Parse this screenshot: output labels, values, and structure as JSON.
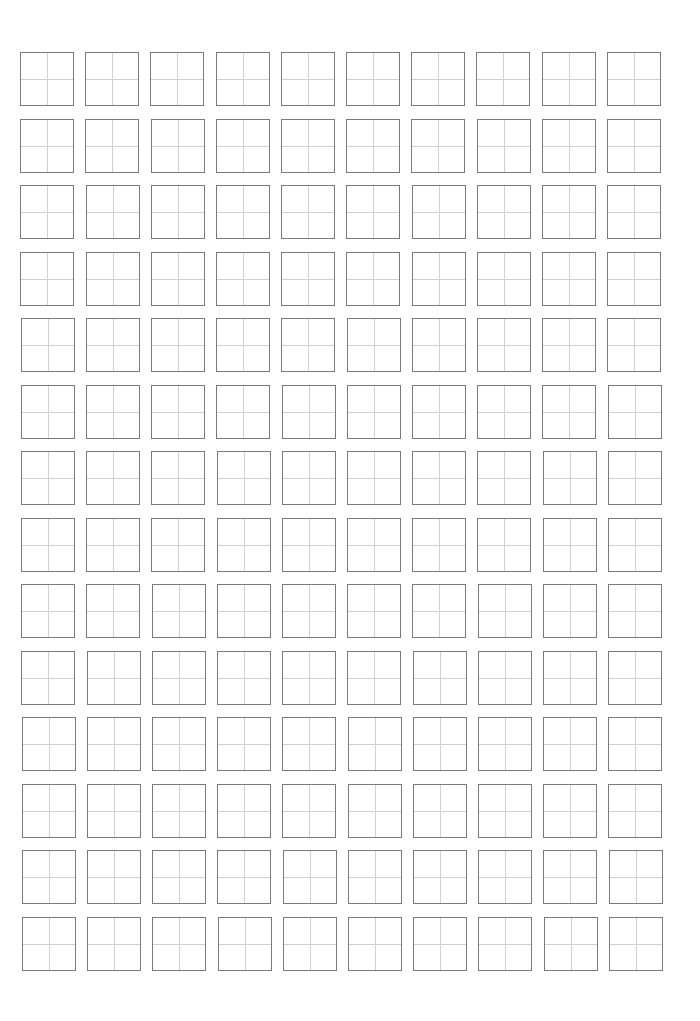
{
  "worksheet": {
    "type": "character-practice-grid",
    "rows": 14,
    "columns": 10,
    "cell_style": "tian-zi-ge (four-quadrant guide)",
    "colors": {
      "border": "#7a7a7a",
      "guide_lines": "#d0d0d0",
      "background": "#ffffff"
    }
  }
}
